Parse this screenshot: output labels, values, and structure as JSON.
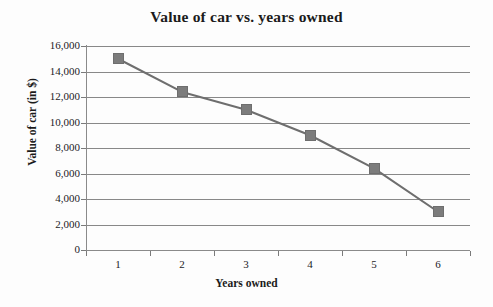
{
  "chart_data": {
    "type": "line",
    "title": "Value of car vs. years owned",
    "xlabel": "Years owned",
    "ylabel": "Value of car (in $)",
    "categories": [
      1,
      2,
      3,
      4,
      5,
      6
    ],
    "x_tick_labels": [
      "1",
      "2",
      "3",
      "4",
      "5",
      "6"
    ],
    "values": [
      15000,
      12400,
      11000,
      9000,
      6400,
      3000
    ],
    "series": [
      {
        "name": "Value of car",
        "values": [
          15000,
          12400,
          11000,
          9000,
          6400,
          3000
        ]
      }
    ],
    "ylim": [
      0,
      16000
    ],
    "xlim": [
      0.5,
      6.5
    ],
    "y_tick_values": [
      0,
      2000,
      4000,
      6000,
      8000,
      10000,
      12000,
      14000,
      16000
    ],
    "y_tick_labels": [
      "0",
      "2,000",
      "4,000",
      "6,000",
      "8,000",
      "10,000",
      "12,000",
      "14,000",
      "16,000"
    ],
    "grid": "horizontal",
    "legend": "none",
    "marker": "square",
    "colors": {
      "line": "#6e6e6e",
      "marker": "#7c7c7c",
      "gridline": "#888888",
      "axis": "#8a8a8a",
      "text": "#1b1b1b",
      "background": "#fdfdfd"
    }
  }
}
